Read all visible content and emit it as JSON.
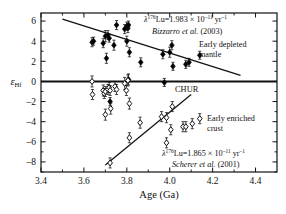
{
  "chart_data": {
    "type": "scatter",
    "title": "",
    "xlabel": "Age (Ga)",
    "ylabel": "εHf",
    "ylabel_base": "ε",
    "ylabel_sub": "Hf",
    "xlim": [
      3.4,
      4.5
    ],
    "ylim": [
      -9.0,
      6.8
    ],
    "xticks": [
      3.4,
      3.6,
      3.8,
      4.0,
      4.2,
      4.4
    ],
    "xticklabels": [
      "3.4",
      "3.6",
      "3.8",
      "4.0",
      "4.2",
      "4.4"
    ],
    "xminor": [
      3.5,
      3.7,
      3.9,
      4.1,
      4.3
    ],
    "yticks": [
      6,
      4,
      2,
      0,
      -2,
      -4,
      -6,
      -8
    ],
    "yticklabels": [
      "6",
      "4",
      "2",
      "0",
      "–2",
      "–4",
      "–6",
      "–8"
    ],
    "grid": false,
    "legend_position": "none",
    "series": [
      {
        "name": "Early depleted mantle",
        "marker": "filled-diamond",
        "color": "#000000",
        "points": [
          {
            "x": 3.638,
            "y": 3.9,
            "yerr": 0.45
          },
          {
            "x": 3.645,
            "y": 4.0,
            "yerr": 0.4
          },
          {
            "x": 3.69,
            "y": 3.8,
            "yerr": 0.45
          },
          {
            "x": 3.7,
            "y": 4.5,
            "yerr": 0.55
          },
          {
            "x": 3.705,
            "y": 2.3,
            "yerr": 0.5
          },
          {
            "x": 3.712,
            "y": 4.6,
            "yerr": 0.45
          },
          {
            "x": 3.718,
            "y": 4.3,
            "yerr": 0.4
          },
          {
            "x": 3.722,
            "y": -2.0,
            "yerr": 0.4
          },
          {
            "x": 3.74,
            "y": 3.6,
            "yerr": 0.5
          },
          {
            "x": 3.752,
            "y": 5.6,
            "yerr": 0.45
          },
          {
            "x": 3.79,
            "y": 5.2,
            "yerr": 0.45
          },
          {
            "x": 3.8,
            "y": 5.5,
            "yerr": 0.4
          },
          {
            "x": 3.805,
            "y": 5.3,
            "yerr": 0.45
          },
          {
            "x": 3.808,
            "y": 5.6,
            "yerr": 0.4
          },
          {
            "x": 3.8,
            "y": 4.0,
            "yerr": 0.5
          },
          {
            "x": 3.812,
            "y": 2.9,
            "yerr": 0.45
          },
          {
            "x": 3.808,
            "y": 0.2,
            "yerr": 0.55
          },
          {
            "x": 3.865,
            "y": 1.9,
            "yerr": 0.45
          },
          {
            "x": 3.968,
            "y": 2.7,
            "yerr": 0.45
          },
          {
            "x": 3.975,
            "y": -0.1,
            "yerr": 0.4
          },
          {
            "x": 4.0,
            "y": 2.9,
            "yerr": 0.5
          },
          {
            "x": 4.01,
            "y": 3.6,
            "yerr": 0.45
          },
          {
            "x": 4.015,
            "y": 1.5,
            "yerr": 0.4
          },
          {
            "x": 4.075,
            "y": 1.7,
            "yerr": 0.4
          },
          {
            "x": 4.09,
            "y": 1.9,
            "yerr": 0.4
          },
          {
            "x": 4.14,
            "y": 2.6,
            "yerr": 0.4
          }
        ]
      },
      {
        "name": "Early enriched crust",
        "marker": "open-diamond",
        "color": "#000000",
        "points": [
          {
            "x": 3.638,
            "y": 0.0,
            "yerr": 0.55
          },
          {
            "x": 3.64,
            "y": -1.3,
            "yerr": 0.5
          },
          {
            "x": 3.69,
            "y": -0.9,
            "yerr": 0.55
          },
          {
            "x": 3.695,
            "y": -1.2,
            "yerr": 0.5
          },
          {
            "x": 3.7,
            "y": -1.0,
            "yerr": 0.5
          },
          {
            "x": 3.7,
            "y": -3.3,
            "yerr": 0.55
          },
          {
            "x": 3.712,
            "y": -0.8,
            "yerr": 0.5
          },
          {
            "x": 3.718,
            "y": -0.6,
            "yerr": 0.5
          },
          {
            "x": 3.722,
            "y": -0.9,
            "yerr": 0.5
          },
          {
            "x": 3.725,
            "y": -2.7,
            "yerr": 0.55
          },
          {
            "x": 3.745,
            "y": -0.5,
            "yerr": 0.5
          },
          {
            "x": 3.752,
            "y": -0.8,
            "yerr": 0.5
          },
          {
            "x": 3.79,
            "y": -0.2,
            "yerr": 0.6
          },
          {
            "x": 3.798,
            "y": -0.9,
            "yerr": 0.5
          },
          {
            "x": 3.805,
            "y": 0.1,
            "yerr": 0.55
          },
          {
            "x": 3.812,
            "y": -2.2,
            "yerr": 0.55
          },
          {
            "x": 3.812,
            "y": -5.6,
            "yerr": 0.5
          },
          {
            "x": 3.722,
            "y": -8.1,
            "yerr": 0.5
          },
          {
            "x": 3.862,
            "y": -4.1,
            "yerr": 0.55
          },
          {
            "x": 3.962,
            "y": -3.5,
            "yerr": 0.5
          },
          {
            "x": 3.985,
            "y": -3.6,
            "yerr": 0.5
          },
          {
            "x": 3.985,
            "y": -6.1,
            "yerr": 0.5
          },
          {
            "x": 4.005,
            "y": -4.8,
            "yerr": 0.5
          },
          {
            "x": 4.012,
            "y": -2.5,
            "yerr": 0.5
          },
          {
            "x": 4.062,
            "y": -4.5,
            "yerr": 0.5
          },
          {
            "x": 4.075,
            "y": -4.5,
            "yerr": 0.5
          },
          {
            "x": 4.105,
            "y": -4.2,
            "yerr": 0.5
          },
          {
            "x": 4.14,
            "y": -3.7,
            "yerr": 0.5
          }
        ]
      }
    ],
    "lines": [
      {
        "name": "depleted-mantle-trend",
        "x1": 3.5,
        "y1": 6.2,
        "x2": 4.33,
        "y2": 0.6
      },
      {
        "name": "enriched-crust-trend",
        "x1": 3.7,
        "y1": -8.3,
        "x2": 4.1,
        "y2": -1.3
      },
      {
        "name": "chur-line",
        "x1": 3.4,
        "y1": 0.0,
        "x2": 4.5,
        "y2": 0.0
      }
    ],
    "annotations": [
      {
        "name": "bizzarro-annotation",
        "line1_prefix": "λ",
        "line1_sup": "176",
        "line1_mid": "Lu=1.983 × 10",
        "line1_sup2": "–11",
        "line1_tail": " yr",
        "line1_sup3": "–1",
        "line2_italic": "Bizzarro et al.",
        "line2_tail": " (2003)"
      },
      {
        "name": "scherer-annotation",
        "line1_prefix": "λ",
        "line1_sup": "176",
        "line1_mid": "Lu=1.865 × 10",
        "line1_sup2": "–11",
        "line1_tail": " yr",
        "line1_sup3": "–1",
        "line2_italic": "Scherer et al.",
        "line2_tail": " (2001)"
      },
      {
        "name": "depleted-mantle-label",
        "line1": "Early depleted",
        "line2": "mantle"
      },
      {
        "name": "enriched-crust-label",
        "line1": "Early enriched",
        "line2": "crust"
      },
      {
        "name": "chur-label",
        "line1": "CHUR"
      }
    ]
  }
}
